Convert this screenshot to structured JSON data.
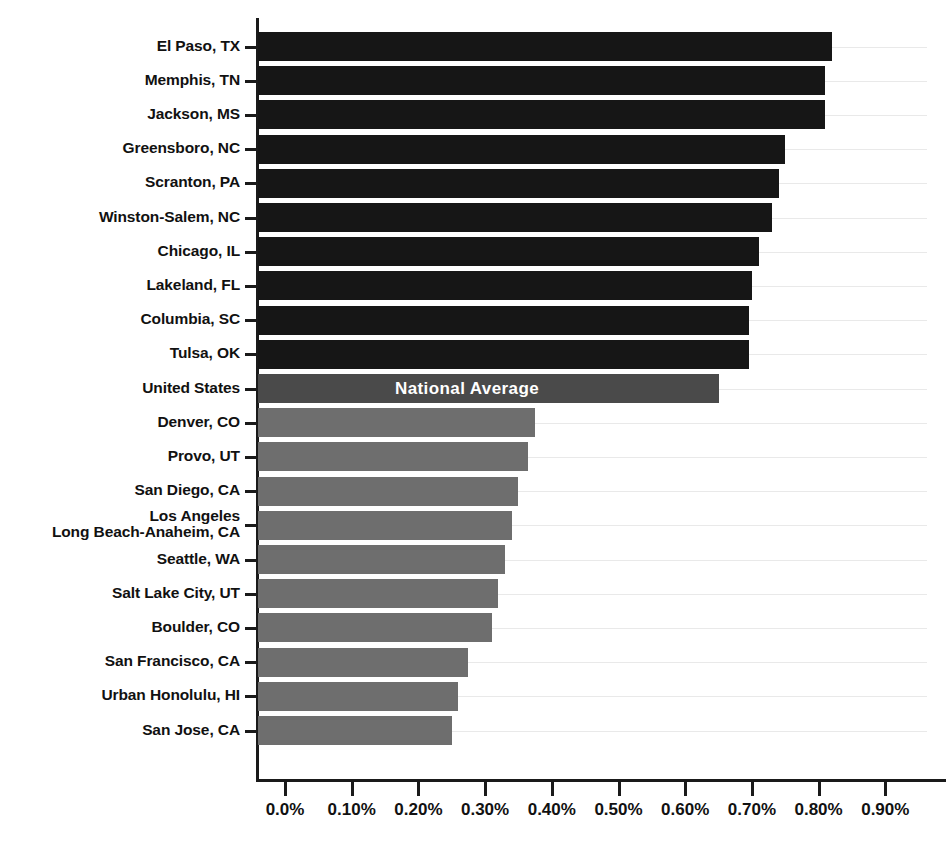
{
  "chart_data": {
    "type": "bar",
    "orientation": "horizontal",
    "title": "",
    "subtitle": "",
    "xlabel": "",
    "ylabel": "",
    "xlim": [
      0.0,
      0.9
    ],
    "grid": true,
    "legend": null,
    "annotations": [
      {
        "text": "National Average",
        "attached_to": "United States"
      }
    ],
    "tick_labels": [
      "0.0%",
      "0.10%",
      "0.20%",
      "0.30%",
      "0.40%",
      "0.50%",
      "0.60%",
      "0.70%",
      "0.80%",
      "0.90%"
    ],
    "tick_values": [
      0.0,
      0.1,
      0.2,
      0.3,
      0.4,
      0.5,
      0.6,
      0.7,
      0.8,
      0.9
    ],
    "categories": [
      "El Paso, TX",
      "Memphis, TN",
      "Jackson, MS",
      "Greensboro, NC",
      "Scranton, PA",
      "Winston-Salem, NC",
      "Chicago, IL",
      "Lakeland, FL",
      "Columbia, SC",
      "Tulsa, OK",
      "United States",
      "Denver, CO",
      "Provo, UT",
      "San Diego, CA",
      "Los Angeles\nLong Beach-Anaheim, CA",
      "Seattle, WA",
      "Salt Lake City, UT",
      "Boulder, CO",
      "San Francisco, CA",
      "Urban Honolulu, HI",
      "San Jose, CA"
    ],
    "values": [
      0.82,
      0.81,
      0.81,
      0.75,
      0.74,
      0.73,
      0.71,
      0.7,
      0.695,
      0.695,
      0.65,
      0.375,
      0.365,
      0.35,
      0.34,
      0.33,
      0.32,
      0.31,
      0.275,
      0.26,
      0.25
    ],
    "value_labels": [
      "0.82%",
      "0.81%",
      "0.81%",
      "0.75%",
      "0.74%",
      "0.73%",
      "0.71%",
      "0.70%",
      "0.70%",
      "0.70%",
      "0.65%",
      "0.38%",
      "0.37%",
      "0.35%",
      "0.34%",
      "0.33%",
      "0.32%",
      "0.31%",
      "0.28%",
      "0.26%",
      "0.25%"
    ],
    "series_groups": [
      {
        "name": "Highest metros",
        "style": "dark",
        "indices": [
          0,
          1,
          2,
          3,
          4,
          5,
          6,
          7,
          8,
          9
        ]
      },
      {
        "name": "National Average",
        "style": "mid",
        "indices": [
          10
        ]
      },
      {
        "name": "Lowest metros",
        "style": "light",
        "indices": [
          11,
          12,
          13,
          14,
          15,
          16,
          17,
          18,
          19,
          20
        ]
      }
    ]
  },
  "colors": {
    "bar_dark": "#161616",
    "bar_mid": "#4a4a4a",
    "bar_light": "#6e6e6e",
    "axis": "#1a1a1a",
    "gridline": "#e9e9e9",
    "text": "#111111",
    "inner_label_text": "#ffffff",
    "background": "#ffffff"
  }
}
